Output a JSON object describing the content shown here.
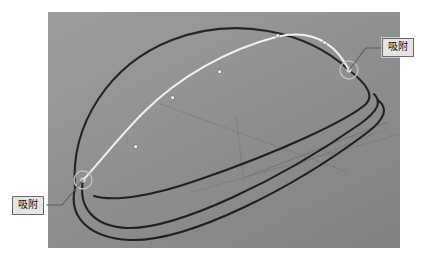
{
  "app": {
    "view_type": "3d-cad-viewport",
    "background_color": "#ffffff",
    "canvas_color": "#8f8f8f"
  },
  "viewport": {
    "name": "modeling-viewport",
    "left": 48,
    "top": 12,
    "width": 352,
    "height": 236
  },
  "callouts": [
    {
      "id": "snap-callout-right",
      "label": "吸附",
      "x": 382,
      "y": 38,
      "leader_from_x": 382,
      "leader_from_y": 48,
      "leader_to_x": 349,
      "leader_to_y": 70
    },
    {
      "id": "snap-callout-left",
      "label": "吸附",
      "x": 12,
      "y": 196,
      "leader_from_x": 46,
      "leader_from_y": 205,
      "leader_to_x": 83,
      "leader_to_y": 180
    }
  ],
  "geometry": {
    "curve_color": "#1a1a1a",
    "highlight_color": "#f2f2f2",
    "grid_color": "#7c7c7c",
    "snap_marker_color": "#b9b9b9",
    "control_point_color": "#ffffff",
    "snap_markers": [
      {
        "name": "snap-marker-right",
        "cx": 301,
        "cy": 58,
        "r": 9
      },
      {
        "name": "snap-marker-left",
        "cx": 35,
        "cy": 168,
        "r": 9
      }
    ],
    "control_points": [
      {
        "cx": 89,
        "cy": 136
      },
      {
        "cx": 126,
        "cy": 86
      },
      {
        "cx": 172,
        "cy": 60
      },
      {
        "cx": 230,
        "cy": 24
      },
      {
        "cx": 277,
        "cy": 31
      }
    ]
  },
  "labels": {
    "snap": "吸附"
  }
}
